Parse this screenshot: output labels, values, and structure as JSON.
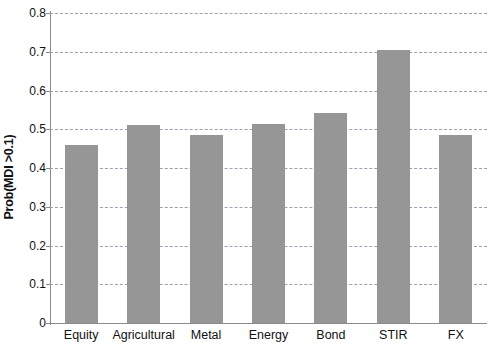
{
  "chart_data": {
    "type": "bar",
    "title": "",
    "xlabel": "",
    "ylabel": "Prob(MDI >0.1)",
    "categories": [
      "Equity",
      "Agricultural",
      "Metal",
      "Energy",
      "Bond",
      "STIR",
      "FX"
    ],
    "values": [
      0.46,
      0.51,
      0.485,
      0.513,
      0.542,
      0.705,
      0.485
    ],
    "ylim": [
      0,
      0.8
    ],
    "ytick_labels": [
      "0",
      "0.1",
      "0.2",
      "0.3",
      "0.4",
      "0.5",
      "0.6",
      "0.7",
      "0.8"
    ],
    "ytick_values": [
      0,
      0.1,
      0.2,
      0.3,
      0.4,
      0.5,
      0.6,
      0.7,
      0.8
    ],
    "grid": true,
    "grid_axis": "y",
    "grid_style": "dashed",
    "legend": null,
    "bar_color": "#969696",
    "grid_color": "#9aa0b0",
    "axis_color": "#8a8a8a",
    "text_color": "#111111"
  }
}
